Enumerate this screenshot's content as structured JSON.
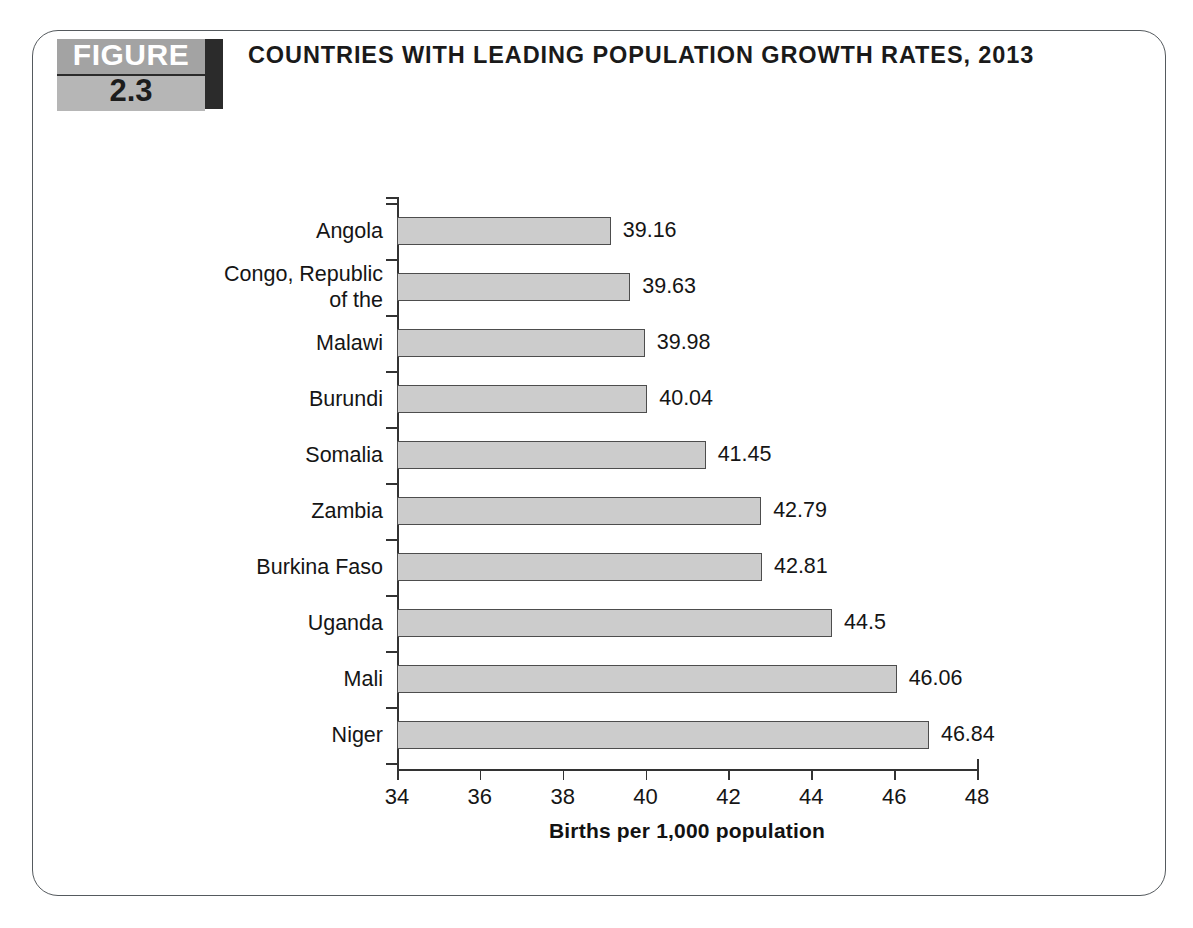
{
  "figure": {
    "badge_word": "FIGURE",
    "badge_number": "2.3",
    "title": "COUNTRIES WITH LEADING POPULATION GROWTH RATES, 2013"
  },
  "chart_data": {
    "type": "bar",
    "orientation": "horizontal",
    "title": "COUNTRIES WITH LEADING POPULATION GROWTH RATES, 2013",
    "xlabel": "Births per 1,000 population",
    "ylabel": "",
    "xlim": [
      34,
      48
    ],
    "xticks": [
      34,
      36,
      38,
      40,
      42,
      44,
      46,
      48
    ],
    "xtick_labels": [
      "34",
      "36",
      "38",
      "40",
      "42",
      "44",
      "46",
      "48"
    ],
    "grid": false,
    "legend": null,
    "bar_fill_color": "#cccccc",
    "bar_border_color": "#4d4d4d",
    "categories": [
      "Angola",
      "Congo, Republic of the",
      "Malawi",
      "Burundi",
      "Somalia",
      "Zambia",
      "Burkina Faso",
      "Uganda",
      "Mali",
      "Niger"
    ],
    "values": [
      39.16,
      39.63,
      39.98,
      40.04,
      41.45,
      42.79,
      42.81,
      44.5,
      46.06,
      46.84
    ],
    "value_labels": [
      "39.16",
      "39.63",
      "39.98",
      "40.04",
      "41.45",
      "42.79",
      "42.81",
      "44.5",
      "46.06",
      "46.84"
    ],
    "category_label_lines": [
      [
        "Angola"
      ],
      [
        "Congo, Republic",
        "of the"
      ],
      [
        "Malawi"
      ],
      [
        "Burundi"
      ],
      [
        "Somalia"
      ],
      [
        "Zambia"
      ],
      [
        "Burkina Faso"
      ],
      [
        "Uganda"
      ],
      [
        "Mali"
      ],
      [
        "Niger"
      ]
    ]
  }
}
